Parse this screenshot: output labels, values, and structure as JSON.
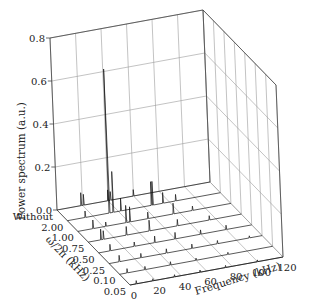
{
  "chart_data": {
    "type": "waterfall-3d",
    "title": "",
    "xlabel": "Frequency (kHz)",
    "ylabel": "ω/2π (kHz)",
    "zlabel": "Power spectrum (a.u.)",
    "x_ticks": [
      0,
      20,
      40,
      60,
      80,
      100,
      120
    ],
    "xlim": [
      0,
      120
    ],
    "y_ticks": [
      "Without",
      "2.00",
      "1.00",
      "0.75",
      "0.50",
      "0.25",
      "0.10",
      "0.05"
    ],
    "z_ticks": [
      0.0,
      0.2,
      0.4,
      0.6,
      0.8
    ],
    "z_tick_labels": [
      "0.0",
      "0.2",
      "0.4",
      "0.6",
      "0.8"
    ],
    "zlim": [
      0,
      0.8
    ],
    "grid": true,
    "series": [
      {
        "name": "Without",
        "peaks": [
          {
            "f": 19,
            "p": 0.06
          },
          {
            "f": 21,
            "p": 0.05
          },
          {
            "f": 40,
            "p": 0.05
          },
          {
            "f": 42,
            "p": 0.04
          },
          {
            "f": 60,
            "p": 0.03
          }
        ]
      },
      {
        "name": "2.00",
        "peaks": [
          {
            "f": 14,
            "p": 0.03
          },
          {
            "f": 33,
            "p": 0.67
          },
          {
            "f": 36,
            "p": 0.19
          },
          {
            "f": 42,
            "p": 0.06
          },
          {
            "f": 66,
            "p": 0.11
          },
          {
            "f": 67,
            "p": 0.11
          },
          {
            "f": 75,
            "p": 0.05
          },
          {
            "f": 85,
            "p": 0.03
          }
        ]
      },
      {
        "name": "1.00",
        "peaks": [
          {
            "f": 12,
            "p": 0.04
          },
          {
            "f": 22,
            "p": 0.02
          },
          {
            "f": 38,
            "p": 0.08
          },
          {
            "f": 41,
            "p": 0.07
          },
          {
            "f": 55,
            "p": 0.03
          },
          {
            "f": 75,
            "p": 0.05
          },
          {
            "f": 90,
            "p": 0.02
          }
        ]
      },
      {
        "name": "0.75",
        "peaks": [
          {
            "f": 10,
            "p": 0.05
          },
          {
            "f": 12,
            "p": 0.04
          },
          {
            "f": 30,
            "p": 0.04
          },
          {
            "f": 48,
            "p": 0.05
          },
          {
            "f": 70,
            "p": 0.03
          },
          {
            "f": 95,
            "p": 0.02
          }
        ]
      },
      {
        "name": "0.50",
        "peaks": [
          {
            "f": 9,
            "p": 0.03
          },
          {
            "f": 28,
            "p": 0.02
          },
          {
            "f": 44,
            "p": 0.03
          },
          {
            "f": 60,
            "p": 0.03
          },
          {
            "f": 80,
            "p": 0.02
          },
          {
            "f": 100,
            "p": 0.02
          }
        ]
      },
      {
        "name": "0.25",
        "peaks": [
          {
            "f": 8,
            "p": 0.03
          },
          {
            "f": 25,
            "p": 0.02
          },
          {
            "f": 45,
            "p": 0.02
          },
          {
            "f": 65,
            "p": 0.02
          },
          {
            "f": 85,
            "p": 0.015
          },
          {
            "f": 110,
            "p": 0.01
          }
        ]
      },
      {
        "name": "0.10",
        "peaks": [
          {
            "f": 6,
            "p": 0.02
          },
          {
            "f": 20,
            "p": 0.015
          },
          {
            "f": 40,
            "p": 0.015
          },
          {
            "f": 60,
            "p": 0.01
          },
          {
            "f": 85,
            "p": 0.01
          }
        ]
      },
      {
        "name": "0.05",
        "peaks": [
          {
            "f": 5,
            "p": 0.015
          },
          {
            "f": 18,
            "p": 0.01
          },
          {
            "f": 35,
            "p": 0.01
          },
          {
            "f": 55,
            "p": 0.01
          },
          {
            "f": 75,
            "p": 0.01
          },
          {
            "f": 100,
            "p": 0.008
          }
        ]
      }
    ]
  }
}
